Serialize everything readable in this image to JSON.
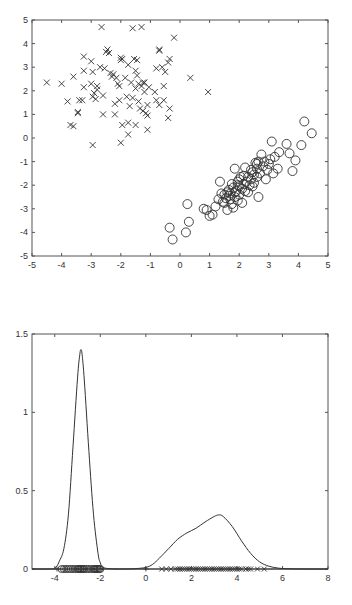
{
  "chart_data": [
    {
      "type": "scatter",
      "title": "",
      "xlabel": "",
      "ylabel": "",
      "xlim": [
        -5,
        5
      ],
      "ylim": [
        -5,
        5
      ],
      "xticks": [
        -5,
        -4,
        -3,
        -2,
        -1,
        0,
        1,
        2,
        3,
        4,
        5
      ],
      "yticks": [
        -5,
        -4,
        -3,
        -2,
        -1,
        0,
        1,
        2,
        3,
        4,
        5
      ],
      "grid": false,
      "series": [
        {
          "name": "class-x",
          "marker": "x",
          "points": [
            [
              -4.5,
              2.35
            ],
            [
              -4.0,
              2.3
            ],
            [
              -3.8,
              1.55
            ],
            [
              -3.6,
              2.6
            ],
            [
              -3.7,
              0.55
            ],
            [
              -3.6,
              0.5
            ],
            [
              -3.45,
              1.1
            ],
            [
              -3.45,
              1.05
            ],
            [
              -3.4,
              1.6
            ],
            [
              -3.3,
              1.6
            ],
            [
              -3.25,
              3.45
            ],
            [
              -3.25,
              2.85
            ],
            [
              -3.25,
              2.15
            ],
            [
              -3.0,
              3.25
            ],
            [
              -3.0,
              2.3
            ],
            [
              -2.95,
              2.8
            ],
            [
              -2.95,
              1.75
            ],
            [
              -2.9,
              1.9
            ],
            [
              -2.85,
              1.65
            ],
            [
              -2.8,
              2.2
            ],
            [
              -2.8,
              2.05
            ],
            [
              -2.7,
              3.0
            ],
            [
              -2.65,
              4.7
            ],
            [
              -2.6,
              1.0
            ],
            [
              -2.6,
              1.8
            ],
            [
              -2.55,
              2.95
            ],
            [
              -2.45,
              3.75
            ],
            [
              -2.4,
              3.6
            ],
            [
              -2.35,
              2.75
            ],
            [
              -2.3,
              2.6
            ],
            [
              -2.25,
              2.7
            ],
            [
              -2.2,
              1.45
            ],
            [
              -2.2,
              1.0
            ],
            [
              -2.15,
              2.55
            ],
            [
              -2.1,
              2.3
            ],
            [
              -2.05,
              2.2
            ],
            [
              -2.05,
              1.6
            ],
            [
              -2.0,
              3.4
            ],
            [
              -2.0,
              3.3
            ],
            [
              -1.95,
              3.35
            ],
            [
              -2.0,
              -0.2
            ],
            [
              -1.95,
              0.55
            ],
            [
              -1.85,
              2.55
            ],
            [
              -1.8,
              1.75
            ],
            [
              -1.75,
              3.1
            ],
            [
              -1.75,
              0.65
            ],
            [
              -1.75,
              0.15
            ],
            [
              -1.7,
              1.35
            ],
            [
              -1.65,
              2.35
            ],
            [
              -1.6,
              1.7
            ],
            [
              -1.6,
              4.65
            ],
            [
              -1.55,
              3.35
            ],
            [
              -1.5,
              2.85
            ],
            [
              -1.5,
              2.1
            ],
            [
              -1.5,
              0.55
            ],
            [
              -1.45,
              3.3
            ],
            [
              -1.45,
              2.65
            ],
            [
              -1.4,
              2.3
            ],
            [
              -1.4,
              1.55
            ],
            [
              -1.35,
              1.25
            ],
            [
              -1.3,
              4.7
            ],
            [
              -1.3,
              2.2
            ],
            [
              -1.25,
              1.15
            ],
            [
              -1.2,
              2.35
            ],
            [
              -1.2,
              1.95
            ],
            [
              -1.15,
              1.05
            ],
            [
              -1.1,
              0.95
            ],
            [
              -1.1,
              0.35
            ],
            [
              -1.05,
              2.15
            ],
            [
              -1.1,
              1.4
            ],
            [
              -0.85,
              1.95
            ],
            [
              -0.8,
              2.95
            ],
            [
              -0.8,
              1.6
            ],
            [
              -0.7,
              3.75
            ],
            [
              -0.7,
              3.7
            ],
            [
              -0.7,
              1.4
            ],
            [
              -0.6,
              3.0
            ],
            [
              -0.55,
              2.2
            ],
            [
              -0.55,
              1.6
            ],
            [
              -0.5,
              2.8
            ],
            [
              -0.4,
              3.2
            ],
            [
              -0.4,
              0.85
            ],
            [
              -0.35,
              3.35
            ],
            [
              -0.35,
              1.25
            ],
            [
              -0.2,
              4.25
            ],
            [
              0.35,
              2.55
            ],
            [
              0.95,
              1.95
            ],
            [
              -2.95,
              -0.3
            ],
            [
              -2.5,
              3.65
            ],
            [
              -1.25,
              2.35
            ]
          ]
        },
        {
          "name": "class-o",
          "marker": "o",
          "points": [
            [
              -0.35,
              -3.8
            ],
            [
              -0.25,
              -4.3
            ],
            [
              0.2,
              -4.0
            ],
            [
              0.25,
              -2.8
            ],
            [
              0.3,
              -3.55
            ],
            [
              0.8,
              -3.0
            ],
            [
              0.9,
              -3.05
            ],
            [
              1.0,
              -3.3
            ],
            [
              1.1,
              -3.25
            ],
            [
              1.2,
              -2.9
            ],
            [
              1.3,
              -2.6
            ],
            [
              1.35,
              -1.85
            ],
            [
              1.4,
              -2.35
            ],
            [
              1.45,
              -2.7
            ],
            [
              1.5,
              -2.4
            ],
            [
              1.55,
              -2.55
            ],
            [
              1.6,
              -2.3
            ],
            [
              1.6,
              -3.05
            ],
            [
              1.65,
              -2.2
            ],
            [
              1.7,
              -2.6
            ],
            [
              1.7,
              -2.35
            ],
            [
              1.75,
              -1.95
            ],
            [
              1.75,
              -2.8
            ],
            [
              1.8,
              -2.1
            ],
            [
              1.8,
              -2.95
            ],
            [
              1.85,
              -2.5
            ],
            [
              1.85,
              -1.3
            ],
            [
              1.9,
              -2.25
            ],
            [
              1.95,
              -1.85
            ],
            [
              1.95,
              -2.65
            ],
            [
              2.0,
              -2.05
            ],
            [
              2.0,
              -2.4
            ],
            [
              2.05,
              -1.65
            ],
            [
              2.1,
              -2.15
            ],
            [
              2.1,
              -2.75
            ],
            [
              2.15,
              -1.95
            ],
            [
              2.2,
              -1.25
            ],
            [
              2.2,
              -2.25
            ],
            [
              2.25,
              -1.85
            ],
            [
              2.3,
              -1.65
            ],
            [
              2.35,
              -2.0
            ],
            [
              2.4,
              -1.35
            ],
            [
              2.4,
              -1.75
            ],
            [
              2.45,
              -2.05
            ],
            [
              2.5,
              -1.55
            ],
            [
              2.5,
              -1.9
            ],
            [
              2.55,
              -1.05
            ],
            [
              2.6,
              -1.3
            ],
            [
              2.6,
              -1.65
            ],
            [
              2.65,
              -2.5
            ],
            [
              2.65,
              -1.0
            ],
            [
              2.7,
              -1.5
            ],
            [
              2.75,
              -0.7
            ],
            [
              2.8,
              -1.2
            ],
            [
              2.85,
              -1.0
            ],
            [
              2.9,
              -1.75
            ],
            [
              2.95,
              -1.35
            ],
            [
              3.0,
              -1.1
            ],
            [
              3.05,
              -0.9
            ],
            [
              3.1,
              -0.15
            ],
            [
              3.15,
              -1.5
            ],
            [
              3.2,
              -0.8
            ],
            [
              3.3,
              -1.3
            ],
            [
              3.35,
              -0.6
            ],
            [
              3.6,
              -0.25
            ],
            [
              3.7,
              -0.65
            ],
            [
              3.8,
              -1.4
            ],
            [
              3.9,
              -0.95
            ],
            [
              4.1,
              -0.3
            ],
            [
              4.2,
              0.7
            ],
            [
              4.45,
              0.2
            ],
            [
              1.95,
              -2.0
            ],
            [
              2.3,
              -2.3
            ],
            [
              1.65,
              -2.45
            ],
            [
              2.45,
              -1.45
            ],
            [
              2.15,
              -1.6
            ],
            [
              1.85,
              -2.3
            ],
            [
              2.6,
              -1.1
            ],
            [
              1.5,
              -2.75
            ],
            [
              2.0,
              -1.75
            ]
          ]
        }
      ]
    },
    {
      "type": "line",
      "title": "",
      "xlabel": "",
      "ylabel": "",
      "xlim": [
        -5,
        8
      ],
      "ylim": [
        0,
        1.5
      ],
      "xticks": [
        -4,
        -2,
        0,
        2,
        4,
        6,
        8
      ],
      "yticks": [
        0,
        0.5,
        1,
        1.5
      ],
      "grid": false,
      "series": [
        {
          "name": "density",
          "x": [
            -5,
            -4.2,
            -4.0,
            -3.9,
            -3.8,
            -3.6,
            -3.4,
            -3.2,
            -3.0,
            -2.9,
            -2.85,
            -2.8,
            -2.7,
            -2.5,
            -2.3,
            -2.1,
            -2.0,
            -1.9,
            -1.6,
            -1.0,
            -0.5,
            0.0,
            0.3,
            0.6,
            1.0,
            1.4,
            1.8,
            2.2,
            2.6,
            3.0,
            3.2,
            3.4,
            3.8,
            4.2,
            4.6,
            5.0,
            5.4,
            5.8,
            6.2,
            7.0,
            8.0
          ],
          "y": [
            0,
            0,
            0.005,
            0.02,
            0.05,
            0.13,
            0.35,
            0.78,
            1.22,
            1.37,
            1.4,
            1.37,
            1.2,
            0.75,
            0.35,
            0.1,
            0.04,
            0.012,
            0.002,
            0.0,
            0.002,
            0.01,
            0.03,
            0.07,
            0.13,
            0.19,
            0.23,
            0.26,
            0.3,
            0.335,
            0.345,
            0.335,
            0.27,
            0.18,
            0.1,
            0.045,
            0.018,
            0.006,
            0.002,
            0.0,
            0.0
          ]
        },
        {
          "name": "class-o-projection",
          "marker": "o",
          "x": [
            -3.7,
            -3.6,
            -3.5,
            -3.4,
            -3.3,
            -3.2,
            -3.1,
            -3.0,
            -2.95,
            -2.9,
            -2.85,
            -2.8,
            -2.75,
            -2.7,
            -2.6,
            -2.5,
            -2.4,
            -2.3,
            -2.25,
            -2.2,
            -2.15,
            -2.1,
            -2.05,
            -2.0
          ],
          "y": 0
        },
        {
          "name": "class-x-projection",
          "marker": "x",
          "x": [
            0.7,
            0.9,
            1.1,
            1.3,
            1.4,
            1.5,
            1.6,
            1.7,
            1.8,
            1.9,
            2.0,
            2.1,
            2.2,
            2.3,
            2.4,
            2.5,
            2.6,
            2.7,
            2.8,
            2.9,
            3.0,
            3.1,
            3.2,
            3.3,
            3.4,
            3.5,
            3.6,
            3.7,
            3.8,
            3.9,
            4.0,
            4.1,
            4.2,
            4.4,
            4.5,
            4.6,
            4.9,
            5.2
          ],
          "y": 0
        },
        {
          "name": "plus-markers",
          "marker": "+",
          "x": [
            -3.9,
            0.0
          ],
          "y": 0
        }
      ]
    }
  ]
}
